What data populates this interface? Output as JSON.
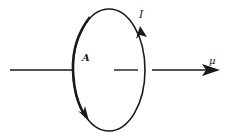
{
  "diagram": {
    "labels": {
      "current": "I",
      "area": "A",
      "moment": "μ"
    },
    "colors": {
      "stroke": "#1a1a1a",
      "background": "#ffffff"
    },
    "elements": [
      {
        "type": "loop",
        "shape": "ellipse",
        "current_direction": "counterclockwise on right side upward"
      },
      {
        "type": "axis",
        "direction": "left-to-right"
      },
      {
        "type": "vector",
        "name": "magnetic moment",
        "label": "μ"
      }
    ]
  }
}
